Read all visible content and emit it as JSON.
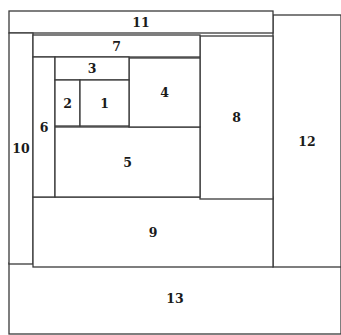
{
  "diagram": {
    "title": "",
    "type": "nested-rectangles",
    "stroke_color": "#3a3a3a",
    "regions": [
      {
        "id": "13",
        "label": "13",
        "x": 9,
        "y": 263,
        "w": 332,
        "h": 71
      },
      {
        "id": "12",
        "label": "12",
        "x": 273,
        "y": 15,
        "w": 68,
        "h": 252
      },
      {
        "id": "11",
        "label": "11",
        "x": 9,
        "y": 11,
        "w": 264,
        "h": 22
      },
      {
        "id": "10",
        "label": "10",
        "x": 9,
        "y": 33,
        "w": 24,
        "h": 231
      },
      {
        "id": "9",
        "label": "9",
        "x": 33,
        "y": 197,
        "w": 240,
        "h": 70
      },
      {
        "id": "8",
        "label": "8",
        "x": 200,
        "y": 36,
        "w": 73,
        "h": 163
      },
      {
        "id": "7",
        "label": "7",
        "x": 33,
        "y": 35,
        "w": 167,
        "h": 22
      },
      {
        "id": "6",
        "label": "6",
        "x": 33,
        "y": 57,
        "w": 22,
        "h": 140
      },
      {
        "id": "5",
        "label": "5",
        "x": 55,
        "y": 127,
        "w": 145,
        "h": 70
      },
      {
        "id": "4",
        "label": "4",
        "x": 129,
        "y": 58,
        "w": 71,
        "h": 69
      },
      {
        "id": "3",
        "label": "3",
        "x": 55,
        "y": 57,
        "w": 74,
        "h": 23
      },
      {
        "id": "2",
        "label": "2",
        "x": 55,
        "y": 80,
        "w": 25,
        "h": 46
      },
      {
        "id": "1",
        "label": "1",
        "x": 80,
        "y": 80,
        "w": 49,
        "h": 46
      }
    ]
  }
}
